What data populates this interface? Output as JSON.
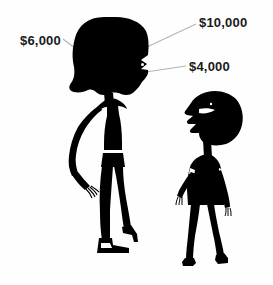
{
  "illustration": {
    "title": "Two female silhouettes with dollar value callouts",
    "background_color": "#fefefe",
    "silhouette_color": "#000000",
    "leader_line_color": "#b4b4b4",
    "label_color": "#1a1a1a"
  },
  "callouts": [
    {
      "id": "callout-10000",
      "name": "callout-10000",
      "value": "$10,000",
      "points_to": "tall-figure-hair",
      "leader": {
        "x1": 196,
        "y1": 24,
        "x2": 147,
        "y2": 47
      }
    },
    {
      "id": "callout-6000",
      "name": "callout-6000",
      "value": "$6,000",
      "points_to": "tall-figure-face",
      "leader": {
        "x1": 63,
        "y1": 39,
        "x2": 87,
        "y2": 57
      }
    },
    {
      "id": "callout-4000",
      "name": "callout-4000",
      "value": "$4,000",
      "points_to": "tall-figure-chin",
      "leader": {
        "x1": 186,
        "y1": 66,
        "x2": 139,
        "y2": 73
      }
    }
  ],
  "figures": [
    {
      "id": "tall-figure",
      "name": "tall-woman-silhouette",
      "description": "Tall woman in black dress, hand on hip, high heels, large bouffant hair",
      "has_belt": true,
      "has_eye_highlight": true
    },
    {
      "id": "short-figure",
      "name": "short-woman-silhouette",
      "description": "Shorter woman in black dress facing left with open mouth, arms down",
      "has_belt": false,
      "has_eye_highlight": true
    }
  ]
}
